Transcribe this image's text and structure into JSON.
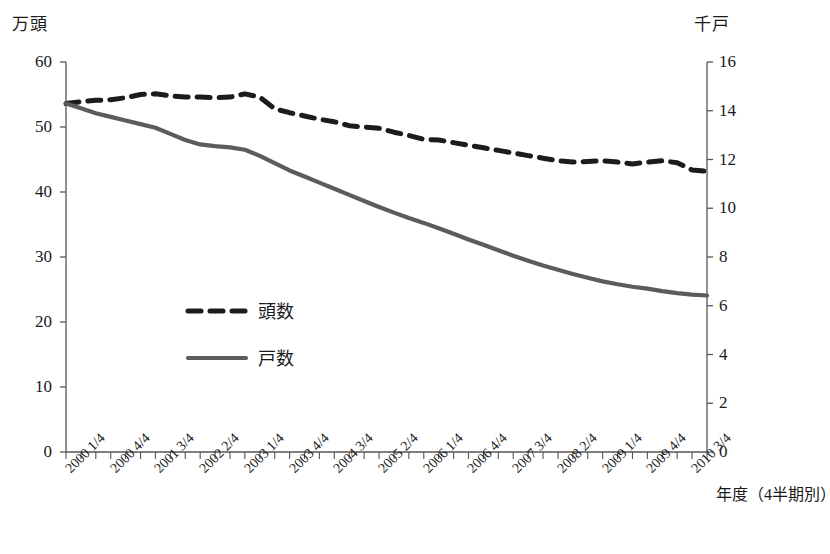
{
  "chart_data": {
    "type": "line",
    "title": "",
    "xlabel": "年度（4半期別）",
    "ylabel_left": "万頭",
    "ylabel_right": "千戸",
    "ylim_left": [
      0,
      60
    ],
    "ylim_right": [
      0,
      16
    ],
    "left_ticks": [
      "0",
      "10",
      "20",
      "30",
      "40",
      "50",
      "60"
    ],
    "right_ticks": [
      "0",
      "2",
      "4",
      "6",
      "8",
      "10",
      "12",
      "14",
      "16"
    ],
    "grid": false,
    "legend_position": "inside-left-center",
    "x": [
      "2000 1/4",
      "2000 2/4",
      "2000 3/4",
      "2000 4/4",
      "2001 1/4",
      "2001 2/4",
      "2001 3/4",
      "2001 4/4",
      "2002 1/4",
      "2002 2/4",
      "2002 3/4",
      "2002 4/4",
      "2003 1/4",
      "2003 2/4",
      "2003 3/4",
      "2003 4/4",
      "2004 1/4",
      "2004 2/4",
      "2004 3/4",
      "2004 4/4",
      "2005 1/4",
      "2005 2/4",
      "2005 3/4",
      "2005 4/4",
      "2006 1/4",
      "2006 2/4",
      "2006 3/4",
      "2006 4/4",
      "2007 1/4",
      "2007 2/4",
      "2007 3/4",
      "2007 4/4",
      "2008 1/4",
      "2008 2/4",
      "2008 3/4",
      "2008 4/4",
      "2009 1/4",
      "2009 2/4",
      "2009 3/4",
      "2009 4/4",
      "2010 1/4",
      "2010 2/4",
      "2010 3/4",
      "2010 4/4"
    ],
    "x_tick_labels_shown": [
      "2000 1/4",
      "2000 4/4",
      "2001 3/4",
      "2002 2/4",
      "2003 1/4",
      "2003 4/4",
      "2004 3/4",
      "2005 2/4",
      "2006 1/4",
      "2006 4/4",
      "2007 3/4",
      "2008 2/4",
      "2009 1/4",
      "2009 4/4",
      "2010 3/4"
    ],
    "series": [
      {
        "name": "頭数",
        "axis": "left",
        "unit": "万頭",
        "style": "dashed",
        "color": "#1c1c1c",
        "values": [
          53.6,
          53.9,
          54.1,
          54.2,
          54.5,
          55.0,
          55.1,
          54.8,
          54.6,
          54.6,
          54.5,
          54.6,
          55.1,
          54.6,
          52.8,
          52.2,
          51.7,
          51.2,
          50.8,
          50.2,
          50.0,
          49.8,
          49.2,
          48.7,
          48.1,
          48.0,
          47.6,
          47.2,
          46.8,
          46.4,
          46.0,
          45.6,
          45.2,
          44.8,
          44.6,
          44.7,
          44.8,
          44.6,
          44.3,
          44.6,
          44.8,
          44.5,
          43.4,
          43.2
        ]
      },
      {
        "name": "戸数",
        "axis": "right",
        "unit": "千戸",
        "style": "solid",
        "color": "#5c5c5c",
        "values": [
          14.3,
          14.1,
          13.9,
          13.75,
          13.6,
          13.45,
          13.3,
          13.05,
          12.8,
          12.62,
          12.55,
          12.5,
          12.4,
          12.15,
          11.85,
          11.55,
          11.3,
          11.05,
          10.8,
          10.55,
          10.3,
          10.05,
          9.82,
          9.6,
          9.4,
          9.18,
          8.95,
          8.72,
          8.5,
          8.28,
          8.05,
          7.85,
          7.65,
          7.48,
          7.3,
          7.15,
          7.0,
          6.88,
          6.78,
          6.7,
          6.6,
          6.52,
          6.46,
          6.42
        ]
      }
    ],
    "legend": [
      {
        "label": "頭数",
        "style": "dashed",
        "color": "#1c1c1c"
      },
      {
        "label": "戸数",
        "style": "solid",
        "color": "#5c5c5c"
      }
    ]
  }
}
